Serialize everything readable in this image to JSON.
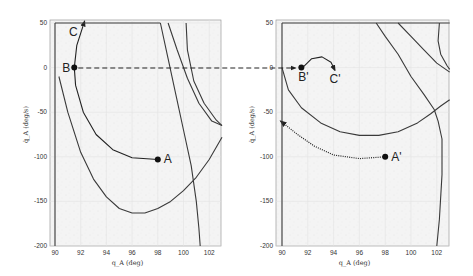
{
  "chart_data": [
    {
      "type": "line",
      "panel": "left",
      "xlabel": "q_A (deg)",
      "ylabel": "q̇_A (deg/s)",
      "xlim": [
        89.5,
        103
      ],
      "ylim": [
        -200,
        50
      ],
      "xticks": [
        90,
        92,
        94,
        96,
        98,
        100,
        102
      ],
      "yticks": [
        50,
        0,
        -50,
        -100,
        -150,
        -200
      ],
      "grid": true,
      "points": [
        {
          "label": "A",
          "x": 98,
          "y": -103
        },
        {
          "label": "B",
          "x": 91.5,
          "y": 0
        },
        {
          "label": "C",
          "x": 92.1,
          "y": 40
        }
      ],
      "series": [
        {
          "name": "trajectory A-B-C",
          "style": "solid-arrow",
          "x": [
            98,
            96,
            94.5,
            93.2,
            92.2,
            91.6,
            91.5,
            91.7,
            92.3
          ],
          "y": [
            -103,
            -101,
            -92,
            -75,
            -50,
            -20,
            0,
            25,
            52
          ]
        },
        {
          "name": "outer boundary",
          "style": "solid",
          "x": [
            90.3,
            91,
            92,
            93,
            94,
            95,
            96,
            97,
            98,
            99,
            100,
            101,
            102,
            103
          ],
          "y": [
            -10,
            -50,
            -95,
            -125,
            -145,
            -158,
            -163,
            -163,
            -158,
            -150,
            -138,
            -123,
            -103,
            -78
          ]
        },
        {
          "name": "upper limit",
          "style": "solid",
          "x": [
            90,
            98.2
          ],
          "y": [
            50,
            50
          ]
        },
        {
          "name": "left limit",
          "style": "solid",
          "x": [
            90,
            90
          ],
          "y": [
            50,
            -200
          ]
        },
        {
          "name": "right boundary",
          "style": "solid",
          "x": [
            98.2,
            98.8,
            99.4,
            100,
            100.6,
            101,
            101.2,
            101.3
          ],
          "y": [
            50,
            10,
            -30,
            -70,
            -110,
            -150,
            -180,
            -200
          ]
        },
        {
          "name": "right curve 1",
          "style": "solid",
          "x": [
            98.8,
            99.5,
            100.3,
            101.2,
            102.2,
            103
          ],
          "y": [
            50,
            20,
            -12,
            -40,
            -60,
            -65
          ]
        },
        {
          "name": "right curve 2",
          "style": "solid",
          "x": [
            100.2,
            100.3,
            100.8,
            101.6,
            102.5,
            103
          ],
          "y": [
            50,
            20,
            -15,
            -40,
            -58,
            -65
          ]
        }
      ]
    },
    {
      "type": "line",
      "panel": "right",
      "xlabel": "q_A (deg)",
      "ylabel": "q̇_A (deg/s)",
      "xlim": [
        89.5,
        103
      ],
      "ylim": [
        -200,
        50
      ],
      "xticks": [
        90,
        92,
        94,
        96,
        98,
        100,
        102
      ],
      "yticks": [
        50,
        0,
        -50,
        -100,
        -150,
        -200
      ],
      "grid": true,
      "points": [
        {
          "label": "A'",
          "x": 98,
          "y": -100
        },
        {
          "label": "B'",
          "x": 91.5,
          "y": 0
        },
        {
          "label": "C'",
          "x": 94,
          "y": -3
        }
      ],
      "series": [
        {
          "name": "trajectory A' (dotted)",
          "style": "dotted-arrow",
          "x": [
            98,
            96,
            94,
            92.5,
            91.2,
            89.9
          ],
          "y": [
            -100,
            -102,
            -98,
            -88,
            -75,
            -60
          ]
        },
        {
          "name": "B'-C' arc",
          "style": "solid-arrow",
          "x": [
            91.6,
            92.3,
            93.1,
            93.8,
            94.1
          ],
          "y": [
            0,
            10,
            12,
            6,
            -3
          ]
        },
        {
          "name": "lower bowl",
          "style": "solid",
          "x": [
            90,
            90.5,
            91.5,
            93,
            94.5,
            96,
            97.5,
            99,
            100.5,
            101.5,
            102.3,
            103
          ],
          "y": [
            0,
            -25,
            -45,
            -62,
            -72,
            -76,
            -76,
            -72,
            -62,
            -52,
            -43,
            -36
          ]
        },
        {
          "name": "upper limit",
          "style": "solid",
          "x": [
            90,
            103
          ],
          "y": [
            50,
            50
          ]
        },
        {
          "name": "left limit",
          "style": "solid",
          "x": [
            90,
            90
          ],
          "y": [
            50,
            -200
          ]
        },
        {
          "name": "diagonal curve 1",
          "style": "solid",
          "x": [
            97.3,
            98,
            99,
            100,
            101,
            101.8,
            102.1,
            102.4,
            102.4,
            102.2,
            102
          ],
          "y": [
            50,
            35,
            15,
            -10,
            -30,
            -47,
            -60,
            -80,
            -120,
            -170,
            -200
          ]
        },
        {
          "name": "diagonal curve 2",
          "style": "solid",
          "x": [
            99,
            100,
            101,
            102,
            103
          ],
          "y": [
            50,
            35,
            20,
            5,
            -5
          ]
        },
        {
          "name": "corner curve",
          "style": "solid",
          "x": [
            102.2,
            102.1,
            102.3,
            102.8,
            103
          ],
          "y": [
            50,
            30,
            15,
            2,
            -2
          ]
        }
      ]
    }
  ],
  "connector": {
    "from": "B",
    "to": "B'",
    "style": "dashed-arrow",
    "y": 0
  },
  "labels": {
    "left": {
      "A": "A",
      "B": "B",
      "C": "C",
      "xlabel": "q_A (deg)",
      "ylabel": "q̇_A (deg/s)"
    },
    "right": {
      "A": "A'",
      "B": "B'",
      "C": "C'",
      "xlabel": "q_A (deg)",
      "ylabel": "q̇_A (deg/s)"
    }
  }
}
